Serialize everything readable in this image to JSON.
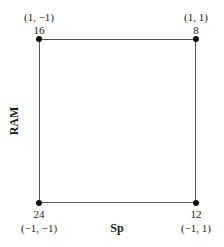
{
  "diagram": {
    "type": "two-factor design square",
    "x_axis_label": "Sp",
    "y_axis_label": "RAM",
    "corners": {
      "top_left": {
        "value": "16",
        "coords": "(1, −1)"
      },
      "top_right": {
        "value": "8",
        "coords": "(1, 1)"
      },
      "bottom_left": {
        "value": "24",
        "coords": "(−1, −1)"
      },
      "bottom_right": {
        "value": "12",
        "coords": "(−1, 1)"
      }
    },
    "colors": {
      "line": "#555555",
      "dot": "#111111",
      "text": "#1a1a1a"
    }
  }
}
